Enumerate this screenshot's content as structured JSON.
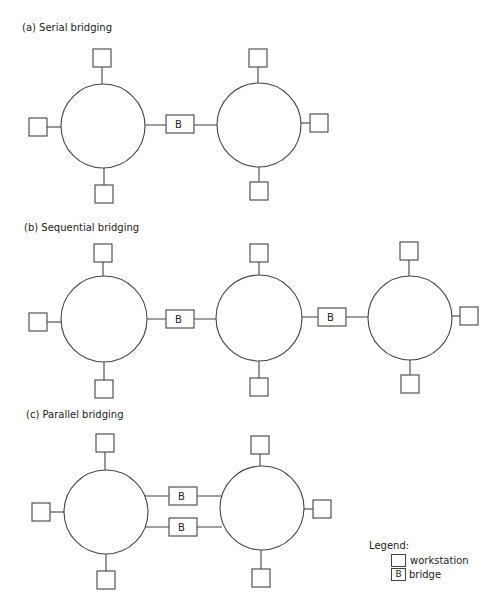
{
  "diagrams": [
    {
      "id": "a",
      "title": "(a) Serial bridging",
      "title_pos": [
        22,
        31
      ],
      "rings": [
        {
          "cx": 103,
          "cy": 126,
          "r": 42
        },
        {
          "cx": 259,
          "cy": 125,
          "r": 42
        }
      ],
      "workstations": [
        {
          "x": 93,
          "y": 49,
          "ring": 0,
          "side": "top"
        },
        {
          "x": 29,
          "y": 118,
          "ring": 0,
          "side": "left"
        },
        {
          "x": 95,
          "y": 185,
          "ring": 0,
          "side": "bottom"
        },
        {
          "x": 249,
          "y": 49,
          "ring": 1,
          "side": "top"
        },
        {
          "x": 310,
          "y": 114,
          "ring": 1,
          "side": "right"
        },
        {
          "x": 250,
          "y": 182,
          "ring": 1,
          "side": "bottom"
        }
      ],
      "bridges": [
        {
          "label": "B",
          "x": 166,
          "y": 115,
          "from": [
            145,
            125
          ],
          "to": [
            217,
            125
          ]
        }
      ]
    },
    {
      "id": "b",
      "title": "(b) Sequential bridging",
      "title_pos": [
        24,
        231
      ],
      "rings": [
        {
          "cx": 104,
          "cy": 319,
          "r": 43
        },
        {
          "cx": 259,
          "cy": 318,
          "r": 43
        },
        {
          "cx": 410,
          "cy": 318,
          "r": 42
        }
      ],
      "workstations": [
        {
          "x": 94,
          "y": 244,
          "ring": 0,
          "side": "top"
        },
        {
          "x": 29,
          "y": 313,
          "ring": 0,
          "side": "left"
        },
        {
          "x": 95,
          "y": 380,
          "ring": 0,
          "side": "bottom"
        },
        {
          "x": 250,
          "y": 244,
          "ring": 1,
          "side": "top"
        },
        {
          "x": 250,
          "y": 378,
          "ring": 1,
          "side": "bottom"
        },
        {
          "x": 400,
          "y": 242,
          "ring": 2,
          "side": "top"
        },
        {
          "x": 460,
          "y": 307,
          "ring": 2,
          "side": "right"
        },
        {
          "x": 401,
          "y": 375,
          "ring": 2,
          "side": "bottom"
        }
      ],
      "bridges": [
        {
          "label": "B",
          "x": 166,
          "y": 310,
          "from": [
            147,
            319
          ],
          "to": [
            216,
            319
          ]
        },
        {
          "label": "B",
          "x": 318,
          "y": 308,
          "from": [
            302,
            317
          ],
          "to": [
            368,
            317
          ]
        }
      ]
    },
    {
      "id": "c",
      "title": "(c) Parallel bridging",
      "title_pos": [
        26,
        418
      ],
      "rings": [
        {
          "cx": 106,
          "cy": 512,
          "r": 42
        },
        {
          "cx": 262,
          "cy": 508,
          "r": 42
        }
      ],
      "workstations": [
        {
          "x": 96,
          "y": 434,
          "ring": 0,
          "side": "top"
        },
        {
          "x": 32,
          "y": 503,
          "ring": 0,
          "side": "left"
        },
        {
          "x": 97,
          "y": 571,
          "ring": 0,
          "side": "bottom"
        },
        {
          "x": 251,
          "y": 436,
          "ring": 1,
          "side": "top"
        },
        {
          "x": 313,
          "y": 500,
          "ring": 1,
          "side": "right"
        },
        {
          "x": 252,
          "y": 569,
          "ring": 1,
          "side": "bottom"
        }
      ],
      "bridges": [
        {
          "label": "B",
          "x": 169,
          "y": 487,
          "from": [
            145,
            496
          ],
          "to": [
            222,
            496
          ]
        },
        {
          "label": "B",
          "x": 169,
          "y": 518,
          "from": [
            145,
            527
          ],
          "to": [
            222,
            527
          ]
        }
      ]
    }
  ],
  "legend": {
    "title": "Legend:",
    "items": [
      {
        "symbol": "",
        "label": "workstation"
      },
      {
        "symbol": "B",
        "label": "bridge"
      }
    ]
  },
  "style": {
    "stroke": "#444444",
    "text": "#222222",
    "background": "#ffffff"
  }
}
